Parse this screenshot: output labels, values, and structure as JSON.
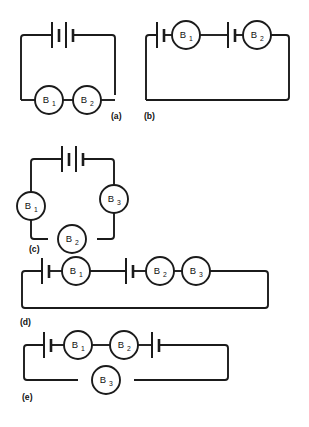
{
  "figure": {
    "title": "",
    "background_color": "#ffffff",
    "line_color": "#1b1b1b",
    "width": 309,
    "height": 427,
    "type": "electrical-circuit-diagram",
    "panel_count": 5
  },
  "panels": [
    {
      "id": "a",
      "label": "(a)",
      "description": "Single loop: two-cell battery on top wire, bulbs B1 and B2 in series on bottom wire",
      "battery_count": 1,
      "battery_cells": [
        2
      ],
      "bulbs": [
        {
          "name": "B",
          "subscript": "1",
          "full": "B1"
        },
        {
          "name": "B",
          "subscript": "2",
          "full": "B2"
        }
      ]
    },
    {
      "id": "b",
      "label": "(b)",
      "description": "Single loop: single-cell battery, bulb B1, single-cell battery, bulb B2 all in series along the top wire",
      "battery_count": 2,
      "battery_cells": [
        1,
        1
      ],
      "bulbs": [
        {
          "name": "B",
          "subscript": "1",
          "full": "B1"
        },
        {
          "name": "B",
          "subscript": "2",
          "full": "B2"
        }
      ]
    },
    {
      "id": "c",
      "label": "(c)",
      "description": "Single loop: two-cell battery on top, bulb B1 on left side, bulb B3 on right side, bulb B2 on bottom wire",
      "battery_count": 1,
      "battery_cells": [
        2
      ],
      "bulbs": [
        {
          "name": "B",
          "subscript": "1",
          "full": "B1"
        },
        {
          "name": "B",
          "subscript": "3",
          "full": "B3"
        },
        {
          "name": "B",
          "subscript": "2",
          "full": "B2"
        }
      ]
    },
    {
      "id": "d",
      "label": "(d)",
      "description": "Single loop: single-cell battery, bulb B1, single-cell battery, bulb B2, bulb B3 in series along the top wire",
      "battery_count": 2,
      "battery_cells": [
        1,
        1
      ],
      "bulbs": [
        {
          "name": "B",
          "subscript": "1",
          "full": "B1"
        },
        {
          "name": "B",
          "subscript": "2",
          "full": "B2"
        },
        {
          "name": "B",
          "subscript": "3",
          "full": "B3"
        }
      ]
    },
    {
      "id": "e",
      "label": "(e)",
      "description": "Loop with top branch containing single-cell battery, bulb B1, bulb B2, single-cell battery; bottom branch contains bulb B3",
      "battery_count": 2,
      "battery_cells": [
        1,
        1
      ],
      "bulbs": [
        {
          "name": "B",
          "subscript": "1",
          "full": "B1"
        },
        {
          "name": "B",
          "subscript": "2",
          "full": "B2"
        },
        {
          "name": "B",
          "subscript": "3",
          "full": "B3"
        }
      ]
    }
  ]
}
